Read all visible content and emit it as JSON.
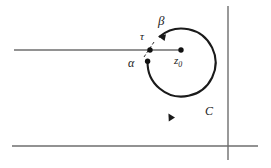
{
  "figure": {
    "background_color": "#ffffff",
    "stroke_color": "#1a1a1a",
    "axis_color": "#6e6e6e",
    "labels": {
      "beta": "β",
      "tau": "τ",
      "alpha": "α",
      "z0_base": "z",
      "z0_sub": "0",
      "contour": "C"
    },
    "geometry": {
      "circle_center_x": 181,
      "circle_center_y": 83,
      "circle_radius": 34,
      "z0_point_x": 181,
      "z0_point_y": 50,
      "tau_point_x": 150,
      "tau_point_y": 50,
      "alpha_point_x": 147,
      "alpha_point_y": 61,
      "beta_point_x": 160,
      "beta_point_y": 36,
      "branch_cut_y": 50,
      "branch_cut_start_x": 14,
      "branch_cut_end_x": 181,
      "bottom_axis_y": 146,
      "bottom_axis_start_x": 12,
      "bottom_axis_end_x": 258,
      "vertical_axis_x": 228,
      "vertical_axis_start_y": 6,
      "vertical_axis_end_y": 160
    }
  }
}
